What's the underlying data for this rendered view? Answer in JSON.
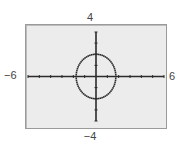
{
  "chart_data": {
    "type": "line",
    "title": "",
    "xlabel": "",
    "ylabel": "",
    "xlim": [
      -6,
      6
    ],
    "ylim": [
      -4,
      4
    ],
    "x_tick_step": 1,
    "y_tick_step": 1,
    "grid": false,
    "window_labels": {
      "xmin": "−6",
      "xmax": "6",
      "ymin": "−4",
      "ymax": "4"
    },
    "series": [
      {
        "name": "ellipse",
        "shape": "ellipse",
        "center": [
          0,
          0
        ],
        "semi_axis_x": 1.75,
        "semi_axis_y": 2,
        "style": "dotted"
      }
    ]
  },
  "colors": {
    "screen_background": "#ececec",
    "screen_border": "#9a9a9a",
    "ink": "#2b2b2b"
  }
}
